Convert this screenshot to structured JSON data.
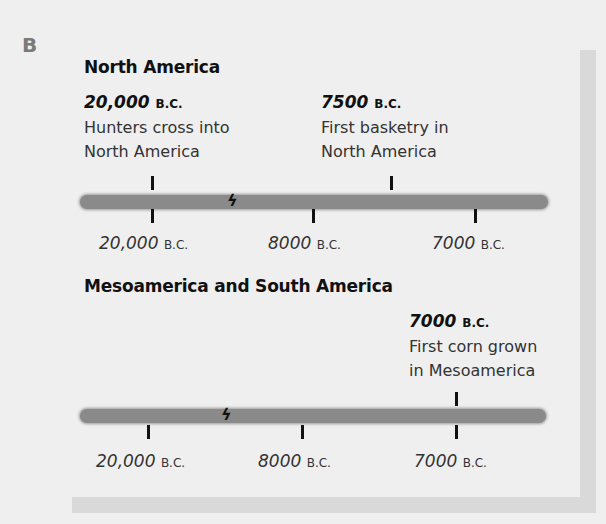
{
  "section_letter": "B",
  "colors": {
    "background": "#efefef",
    "bar": "#8a8a8a",
    "frame_shadow": "#d9d9d9",
    "text": "#1a1a1a",
    "section_letter": "#7a7a7a"
  },
  "timelines": [
    {
      "heading": "North America",
      "axis_ticks": [
        {
          "value": "20,000",
          "suffix": "B.C."
        },
        {
          "value": "8000",
          "suffix": "B.C."
        },
        {
          "value": "7000",
          "suffix": "B.C."
        }
      ],
      "break_icon": "lightning-break-icon",
      "events": [
        {
          "date": "20,000",
          "suffix": "B.C.",
          "line1": "Hunters cross into",
          "line2": "North America"
        },
        {
          "date": "7500",
          "suffix": "B.C.",
          "line1": "First basketry in",
          "line2": "North America"
        }
      ]
    },
    {
      "heading": "Mesoamerica and South America",
      "axis_ticks": [
        {
          "value": "20,000",
          "suffix": "B.C."
        },
        {
          "value": "8000",
          "suffix": "B.C."
        },
        {
          "value": "7000",
          "suffix": "B.C."
        }
      ],
      "break_icon": "lightning-break-icon",
      "events": [
        {
          "date": "7000",
          "suffix": "B.C.",
          "line1": "First corn grown",
          "line2": "in Mesoamerica"
        }
      ]
    }
  ]
}
